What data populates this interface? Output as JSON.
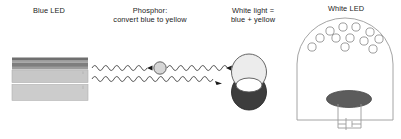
{
  "diagram": {
    "labels": {
      "blue_led_left": "Blue LED",
      "phosphor_line1": "Phosphor:",
      "phosphor_line2": "convert blue to yellow",
      "white_light_line1": "White light =",
      "white_light_line2": "blue + yellow",
      "white_led_package": "White LED",
      "yellow_phosphor": "Yellow phosphor",
      "blue_led_chip": "Blue LED"
    },
    "colors": {
      "background": "#ffffff",
      "text": "#1a1a1a",
      "text_muted": "#8e8e8e",
      "stroke": "#3a3a3a",
      "stroke_light": "#6e6e6e",
      "layer_dark": "#6b6b6b",
      "layer_mid": "#8d8d8d",
      "layer_light": "#c2c2c2",
      "layer_pale": "#cfcfcf",
      "phosphor_particle": "#d2d2d2",
      "white_disc": "#e9e9e9",
      "yellow_disc": "#3d3d3d",
      "chip_fill": "#5a5a5a",
      "package_stroke": "#8a8a8a"
    },
    "led_stack": {
      "x": 12,
      "width": 76,
      "layers": [
        {
          "name": "contact-layer",
          "y": 58,
          "height": 3,
          "fill": "#6b6b6b"
        },
        {
          "name": "p-layer",
          "y": 61,
          "height": 2,
          "fill": "#9c9c9c"
        },
        {
          "name": "active-layer",
          "y": 63,
          "height": 4,
          "fill": "#7d7d7d"
        },
        {
          "name": "n-layer",
          "y": 67,
          "height": 3,
          "fill": "#9a9a9a"
        },
        {
          "name": "buffer-layer",
          "y": 70,
          "height": 12,
          "fill": "#c6c6c6"
        },
        {
          "name": "substrate-layer",
          "y": 84,
          "height": 16,
          "fill": "#cbcbcb"
        }
      ]
    },
    "waves": {
      "upper": {
        "name": "blue-photon-wave-upper",
        "y": 68,
        "x_start": 92,
        "x_end": 232,
        "amplitude": 4,
        "period": 11
      },
      "lower": {
        "name": "blue-photon-wave-lower",
        "y": 79,
        "x_start": 92,
        "x_end": 232,
        "amplitude": 4,
        "period": 11
      }
    },
    "phosphor_particle": {
      "cx": 160,
      "cy": 68,
      "r": 6
    },
    "white_light": {
      "blue_disc": {
        "cx": 249,
        "cy": 72,
        "rx": 17,
        "ry": 18
      },
      "yellow_disc": {
        "cx": 249,
        "cy": 92,
        "rx": 17,
        "ry": 18
      }
    },
    "package": {
      "x": 297,
      "y": 18,
      "width": 96,
      "height": 102,
      "dome_height": 46
    },
    "phosphor_dots": [
      {
        "cx": 330,
        "cy": 31,
        "r": 4
      },
      {
        "cx": 342,
        "cy": 27,
        "r": 4
      },
      {
        "cx": 355,
        "cy": 27,
        "r": 4
      },
      {
        "cx": 369,
        "cy": 31,
        "r": 4
      },
      {
        "cx": 321,
        "cy": 37,
        "r": 4
      },
      {
        "cx": 336,
        "cy": 37,
        "r": 4
      },
      {
        "cx": 350,
        "cy": 37,
        "r": 4
      },
      {
        "cx": 363,
        "cy": 40,
        "r": 4
      },
      {
        "cx": 378,
        "cy": 38,
        "r": 4
      },
      {
        "cx": 313,
        "cy": 46,
        "r": 4
      },
      {
        "cx": 345,
        "cy": 46,
        "r": 4
      },
      {
        "cx": 372,
        "cy": 48,
        "r": 4
      }
    ],
    "chip": {
      "cx": 349,
      "cy": 100,
      "rx": 22,
      "ry": 8
    },
    "leads": {
      "left_x": 338,
      "right_x": 360,
      "top_y": 105,
      "bottom_y": 128,
      "cross_y": 124
    }
  }
}
